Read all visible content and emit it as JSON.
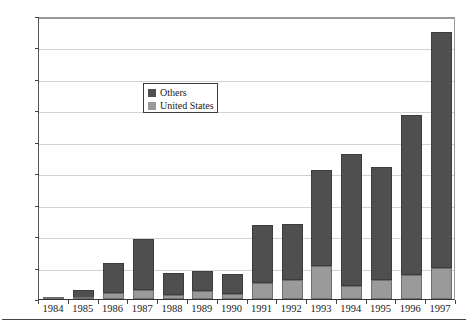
{
  "chart_data": {
    "type": "bar",
    "subtype": "stacked-vertical",
    "title": "",
    "xlabel": "",
    "ylabel": "U.S. dollars (billions)",
    "categories": [
      "1984",
      "1985",
      "1986",
      "1987",
      "1988",
      "1989",
      "1990",
      "1991",
      "1992",
      "1993",
      "1994",
      "1995",
      "1996",
      "1997"
    ],
    "series": [
      {
        "name": "United States",
        "color": "#9a9a9a",
        "values": [
          0.3,
          0.2,
          2.0,
          3.0,
          1.3,
          2.5,
          1.7,
          5.0,
          6.0,
          10.5,
          4.0,
          6.0,
          7.5,
          10.0
        ]
      },
      {
        "name": "Others",
        "color": "#4f4f4f",
        "values": [
          0.4,
          2.8,
          9.5,
          16.0,
          7.0,
          6.3,
          6.1,
          18.5,
          18.0,
          30.5,
          42.0,
          36.0,
          51.0,
          75.0
        ]
      }
    ],
    "totals": [
      0.7,
      3.0,
      11.5,
      19.0,
      8.3,
      8.8,
      7.8,
      23.5,
      24.0,
      41.0,
      46.0,
      42.0,
      58.5,
      85.0
    ],
    "ylim": [
      0,
      90
    ],
    "yticks": [
      0,
      10,
      20,
      30,
      40,
      50,
      60,
      70,
      80,
      90
    ],
    "ytick_labels": [
      "0",
      "10",
      "20",
      "30",
      "40",
      "50",
      "60",
      "70",
      "80",
      "90"
    ],
    "grid": "horizontal",
    "legend_position": "upper-center-left",
    "legend_entries": [
      "Others",
      "United States"
    ]
  },
  "colors": {
    "others": "#4f4f4f",
    "united_states": "#9a9a9a",
    "gridline": "#d2d2d2",
    "axis": "#444444",
    "background": "#ffffff"
  }
}
